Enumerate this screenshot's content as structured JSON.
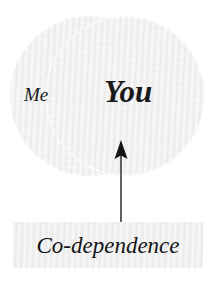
{
  "diagram": {
    "type": "venn-with-callout",
    "background_color": "#ffffff",
    "shape_fill_color": "#f1f1f1",
    "text_color": "#1a1a1a",
    "circles": [
      {
        "id": "me",
        "label": "Me"
      },
      {
        "id": "you",
        "label": "You"
      }
    ],
    "callout": {
      "label": "Co-dependence",
      "points_to": "You",
      "arrow_direction": "up"
    }
  }
}
